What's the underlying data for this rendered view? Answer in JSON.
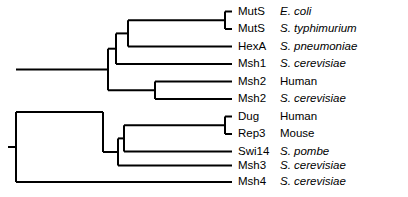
{
  "figure": {
    "type": "phylogenetic-tree",
    "orientation": "left-to-right",
    "line_color": "#000000",
    "background_color": "#ffffff",
    "label_font_size_px": 11.5
  },
  "leaves": [
    {
      "gene": "MutS",
      "species": "E. coli",
      "species_style": "italic",
      "row": 0,
      "y": 11.5,
      "tip_x": 232
    },
    {
      "gene": "MutS",
      "species": "S. typhimurium",
      "species_style": "italic",
      "row": 1,
      "y": 29.0,
      "tip_x": 232
    },
    {
      "gene": "HexA",
      "species": "S. pneumoniae",
      "species_style": "italic",
      "row": 2,
      "y": 46.5,
      "tip_x": 232
    },
    {
      "gene": "Msh1",
      "species": "S. cerevisiae",
      "species_style": "italic",
      "row": 3,
      "y": 64.0,
      "tip_x": 232
    },
    {
      "gene": "Msh2",
      "species": "Human",
      "species_style": "roman",
      "row": 4,
      "y": 81.5,
      "tip_x": 232
    },
    {
      "gene": "Msh2",
      "species": "S. cerevisiae",
      "species_style": "italic",
      "row": 5,
      "y": 99.0,
      "tip_x": 232
    },
    {
      "gene": "Dug",
      "species": "Human",
      "species_style": "roman",
      "row": 6,
      "y": 116.5,
      "tip_x": 232
    },
    {
      "gene": "Rep3",
      "species": "Mouse",
      "species_style": "roman",
      "row": 7,
      "y": 134.0,
      "tip_x": 232
    },
    {
      "gene": "Swi14",
      "species": "S. pombe",
      "species_style": "italic",
      "row": 8,
      "y": 151.5,
      "tip_x": 232
    },
    {
      "gene": "Msh3",
      "species": "S. cerevisiae",
      "species_style": "italic",
      "row": 9,
      "y": 165.5,
      "tip_x": 232
    },
    {
      "gene": "Msh4",
      "species": "S. cerevisiae",
      "species_style": "italic",
      "row": 10,
      "y": 182.0,
      "tip_x": 232
    }
  ],
  "nodes": [
    {
      "name": "root",
      "x": 16,
      "y_top": 112.0,
      "y_bottom": 182.0,
      "parent_x": 8
    },
    {
      "name": "node-msh4-split",
      "x": 16,
      "y_top": 112.0,
      "y_bottom": 182.0,
      "parent_x": 8
    },
    {
      "name": "node-muts-clade",
      "x": 225,
      "y_top": 11.5,
      "y_bottom": 29.0,
      "parent_x": 128
    },
    {
      "name": "node-bacterial",
      "x": 128,
      "y_top": 20.2,
      "y_bottom": 46.5,
      "parent_x": 116
    },
    {
      "name": "node-msh1",
      "x": 116,
      "y_top": 33.4,
      "y_bottom": 64.0,
      "parent_x": 108
    },
    {
      "name": "node-msh2-pair",
      "x": 155,
      "y_top": 81.5,
      "y_bottom": 99.0,
      "parent_x": 108
    },
    {
      "name": "node-upper",
      "x": 108,
      "y_top": 48.7,
      "y_bottom": 90.2,
      "parent_x": 16
    },
    {
      "name": "node-dug-rep3",
      "x": 225,
      "y_top": 116.5,
      "y_bottom": 134.0,
      "parent_x": 124
    },
    {
      "name": "node-swi14",
      "x": 124,
      "y_top": 125.2,
      "y_bottom": 151.5,
      "parent_x": 118
    },
    {
      "name": "node-msh3",
      "x": 118,
      "y_top": 138.4,
      "y_bottom": 165.5,
      "parent_x": 103
    },
    {
      "name": "node-lower",
      "x": 103,
      "y_top": 152.0,
      "y_bottom": 152.0,
      "parent_x": 16
    }
  ],
  "branches": {
    "root_stub": {
      "x1": 8,
      "x2": 16,
      "y": 147.0
    },
    "horizontals": [
      {
        "name": "branch-mutS-ecoli",
        "x1": 225,
        "x2": 232,
        "y": 11.5
      },
      {
        "name": "branch-mutS-styphimurium",
        "x1": 225,
        "x2": 232,
        "y": 29.0
      },
      {
        "name": "branch-mutS-clade-stem",
        "x1": 128,
        "x2": 225,
        "y": 20.2
      },
      {
        "name": "branch-hexA",
        "x1": 128,
        "x2": 232,
        "y": 46.5
      },
      {
        "name": "branch-bacterial-stem",
        "x1": 116,
        "x2": 128,
        "y": 33.4
      },
      {
        "name": "branch-msh1",
        "x1": 116,
        "x2": 232,
        "y": 64.0
      },
      {
        "name": "branch-msh1-clade-stem",
        "x1": 108,
        "x2": 116,
        "y": 48.7
      },
      {
        "name": "branch-msh2-human",
        "x1": 155,
        "x2": 232,
        "y": 81.5
      },
      {
        "name": "branch-msh2-scerevisiae",
        "x1": 155,
        "x2": 232,
        "y": 99.0
      },
      {
        "name": "branch-msh2-pair-stem",
        "x1": 108,
        "x2": 155,
        "y": 90.2
      },
      {
        "name": "branch-upper-clade-stem",
        "x1": 16,
        "x2": 108,
        "y": 69.5
      },
      {
        "name": "branch-dug-human",
        "x1": 225,
        "x2": 232,
        "y": 116.5
      },
      {
        "name": "branch-rep3-mouse",
        "x1": 225,
        "x2": 232,
        "y": 134.0
      },
      {
        "name": "branch-dug-rep3-stem",
        "x1": 124,
        "x2": 225,
        "y": 125.2
      },
      {
        "name": "branch-swi14",
        "x1": 124,
        "x2": 232,
        "y": 151.5
      },
      {
        "name": "branch-swi14-clade-stem",
        "x1": 118,
        "x2": 124,
        "y": 138.4
      },
      {
        "name": "branch-msh3",
        "x1": 118,
        "x2": 232,
        "y": 165.5
      },
      {
        "name": "branch-lower-clade-stem",
        "x1": 103,
        "x2": 118,
        "y": 152.0
      },
      {
        "name": "branch-lower-to-root",
        "x1": 16,
        "x2": 103,
        "y": 112.0
      },
      {
        "name": "branch-msh4",
        "x1": 16,
        "x2": 232,
        "y": 182.0
      }
    ],
    "verticals": [
      {
        "name": "vline-root",
        "x": 16,
        "y1": 112.0,
        "y2": 182.0
      },
      {
        "name": "vline-mutS-clade",
        "x": 225,
        "y1": 11.5,
        "y2": 29.0
      },
      {
        "name": "vline-bacterial",
        "x": 128,
        "y1": 20.2,
        "y2": 46.5
      },
      {
        "name": "vline-msh1-clade",
        "x": 116,
        "y1": 33.4,
        "y2": 64.0
      },
      {
        "name": "vline-msh2-pair",
        "x": 155,
        "y1": 81.5,
        "y2": 99.0
      },
      {
        "name": "vline-upper-clade",
        "x": 108,
        "y1": 48.7,
        "y2": 90.2
      },
      {
        "name": "vline-dug-rep3",
        "x": 225,
        "y1": 116.5,
        "y2": 134.0
      },
      {
        "name": "vline-swi14-clade",
        "x": 124,
        "y1": 125.2,
        "y2": 151.5
      },
      {
        "name": "vline-msh3-clade",
        "x": 118,
        "y1": 138.4,
        "y2": 165.5
      },
      {
        "name": "vline-lower-clade",
        "x": 103,
        "y1": 112.0,
        "y2": 152.0
      }
    ]
  },
  "label_layout": {
    "label_x": 238,
    "gene_column_width": 40,
    "species_column_offset": 42
  }
}
